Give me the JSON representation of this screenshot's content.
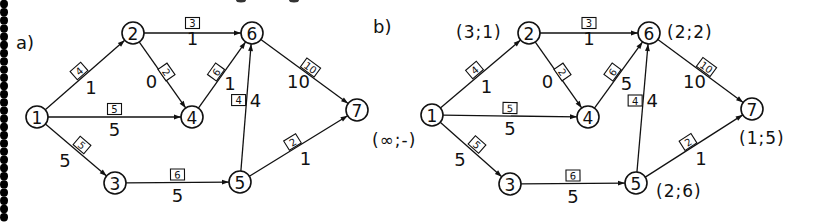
{
  "figure": {
    "left_border": "dotted-vertical-rule"
  },
  "panels": [
    {
      "id": "a",
      "label": "a)",
      "nodes": [
        {
          "id": "1",
          "label": "1",
          "x": 37,
          "y": 117
        },
        {
          "id": "2",
          "label": "2",
          "x": 133,
          "y": 33
        },
        {
          "id": "3",
          "label": "3",
          "x": 115,
          "y": 183
        },
        {
          "id": "4",
          "label": "4",
          "x": 192,
          "y": 117
        },
        {
          "id": "5",
          "label": "5",
          "x": 240,
          "y": 182
        },
        {
          "id": "6",
          "label": "6",
          "x": 252,
          "y": 33
        },
        {
          "id": "7",
          "label": "7",
          "x": 357,
          "y": 110
        }
      ],
      "edges": [
        {
          "from": "1",
          "to": "2",
          "capacity": "4",
          "flow": "1"
        },
        {
          "from": "1",
          "to": "4",
          "capacity": "5",
          "flow": "5"
        },
        {
          "from": "1",
          "to": "3",
          "capacity": "5",
          "flow": "5"
        },
        {
          "from": "2",
          "to": "6",
          "capacity": "3",
          "flow": "1"
        },
        {
          "from": "2",
          "to": "4",
          "capacity": "2",
          "flow": "0"
        },
        {
          "from": "4",
          "to": "6",
          "capacity": "6",
          "flow": "1"
        },
        {
          "from": "3",
          "to": "5",
          "capacity": "6",
          "flow": "5"
        },
        {
          "from": "5",
          "to": "6",
          "capacity": "4",
          "flow": "4"
        },
        {
          "from": "6",
          "to": "7",
          "capacity": "10",
          "flow": "10"
        },
        {
          "from": "5",
          "to": "7",
          "capacity": "2",
          "flow": "1"
        }
      ],
      "node_marks": []
    },
    {
      "id": "b",
      "label": "b)",
      "nodes": [
        {
          "id": "1",
          "label": "1",
          "x": 432,
          "y": 115
        },
        {
          "id": "2",
          "label": "2",
          "x": 529,
          "y": 33
        },
        {
          "id": "3",
          "label": "3",
          "x": 510,
          "y": 184
        },
        {
          "id": "4",
          "label": "4",
          "x": 588,
          "y": 117
        },
        {
          "id": "5",
          "label": "5",
          "x": 636,
          "y": 183
        },
        {
          "id": "6",
          "label": "6",
          "x": 649,
          "y": 33
        },
        {
          "id": "7",
          "label": "7",
          "x": 752,
          "y": 109
        }
      ],
      "edges": [
        {
          "from": "1",
          "to": "2",
          "capacity": "4",
          "flow": "1"
        },
        {
          "from": "1",
          "to": "4",
          "capacity": "5",
          "flow": "5"
        },
        {
          "from": "1",
          "to": "3",
          "capacity": "5",
          "flow": "5"
        },
        {
          "from": "2",
          "to": "6",
          "capacity": "3",
          "flow": "1"
        },
        {
          "from": "2",
          "to": "4",
          "capacity": "2",
          "flow": "0"
        },
        {
          "from": "4",
          "to": "6",
          "capacity": "6",
          "flow": "5"
        },
        {
          "from": "3",
          "to": "5",
          "capacity": "6",
          "flow": "5"
        },
        {
          "from": "5",
          "to": "6",
          "capacity": "4",
          "flow": "4"
        },
        {
          "from": "6",
          "to": "7",
          "capacity": "10",
          "flow": "10"
        },
        {
          "from": "5",
          "to": "7",
          "capacity": "2",
          "flow": "1"
        }
      ],
      "node_marks": [
        {
          "node": "1",
          "text": "(∞;-)"
        },
        {
          "node": "2",
          "text": "(3;1)"
        },
        {
          "node": "6",
          "text": "(2;2)"
        },
        {
          "node": "7",
          "text": "(1;5)"
        },
        {
          "node": "5",
          "text": "(2;6)"
        }
      ]
    }
  ]
}
